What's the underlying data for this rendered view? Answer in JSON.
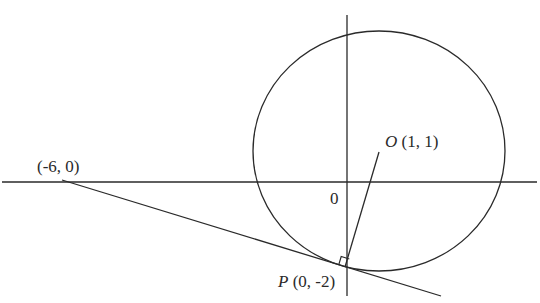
{
  "diagram": {
    "colors": {
      "stroke": "#2a2a2a",
      "background": "#ffffff"
    },
    "labels": {
      "point_a": "(-6, 0)",
      "center_name": "O",
      "center_coords": "(1, 1)",
      "origin": "0",
      "tangent_point_name": "P",
      "tangent_point_coords": "(0, -2)"
    },
    "elements": {
      "circle": {
        "center": [
          1,
          1
        ],
        "passes_through": [
          0,
          -2
        ]
      },
      "tangent_line": {
        "through": [
          [
            -6,
            0
          ],
          [
            0,
            -2
          ]
        ]
      },
      "radius_segment": {
        "from": [
          1,
          1
        ],
        "to": [
          0,
          -2
        ]
      },
      "right_angle_marker_at": [
        0,
        -2
      ]
    }
  }
}
